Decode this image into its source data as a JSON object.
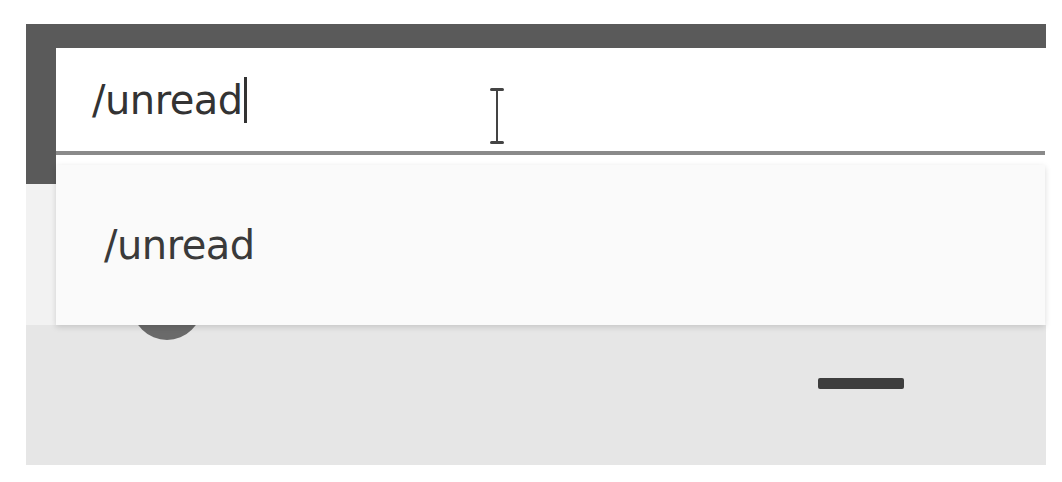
{
  "search": {
    "value": "/unread",
    "cursor": "text-ibeam"
  },
  "dropdown": {
    "items": [
      {
        "label": "/unread"
      }
    ]
  },
  "icons": {
    "avatar": "avatar-circle",
    "minimize": "minimize-dash"
  },
  "colors": {
    "frame": "#5a5a5a",
    "input_bg": "#ffffff",
    "dropdown_bg": "#fafafa",
    "panel_bg": "#e6e6e6",
    "text": "#333333"
  }
}
